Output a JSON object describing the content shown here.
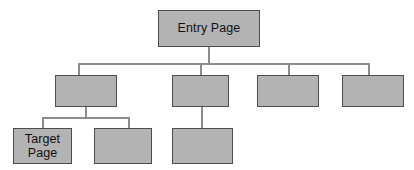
{
  "diagram": {
    "type": "site-map-tree",
    "colors": {
      "node_fill": "#b3b3b3",
      "node_border": "#4d4d4d",
      "connector": "#8c8c8c",
      "background": "#ffffff",
      "text": "#111111"
    },
    "levels": [
      {
        "name": "level-1",
        "nodes": [
          {
            "id": "entry-page",
            "label": "Entry Page",
            "x": 158,
            "y": 10,
            "w": 102,
            "h": 37
          }
        ]
      },
      {
        "name": "level-2",
        "nodes": [
          {
            "id": "level2-node-1",
            "label": "",
            "x": 55,
            "y": 75,
            "w": 62,
            "h": 32
          },
          {
            "id": "level2-node-2",
            "label": "",
            "x": 172,
            "y": 75,
            "w": 57,
            "h": 32
          },
          {
            "id": "level2-node-3",
            "label": "",
            "x": 257,
            "y": 75,
            "w": 62,
            "h": 32
          },
          {
            "id": "level2-node-4",
            "label": "",
            "x": 342,
            "y": 75,
            "w": 62,
            "h": 32
          }
        ]
      },
      {
        "name": "level-3",
        "nodes": [
          {
            "id": "target-page",
            "label": "Target\nPage",
            "x": 13,
            "y": 128,
            "w": 59,
            "h": 36
          },
          {
            "id": "level3-node-2",
            "label": "",
            "x": 94,
            "y": 128,
            "w": 58,
            "h": 36
          },
          {
            "id": "level3-node-3",
            "label": "",
            "x": 172,
            "y": 128,
            "w": 61,
            "h": 36
          }
        ]
      }
    ],
    "connectors": [
      {
        "id": "entry-stem-down",
        "orientation": "v",
        "x": 208,
        "y": 47,
        "length": 17
      },
      {
        "id": "level2-trunk",
        "orientation": "h",
        "x": 78,
        "y": 63,
        "length": 290
      },
      {
        "id": "branch-to-level2-node-1",
        "orientation": "v",
        "x": 78,
        "y": 63,
        "length": 12
      },
      {
        "id": "branch-to-level2-node-2",
        "orientation": "v",
        "x": 200,
        "y": 63,
        "length": 12
      },
      {
        "id": "branch-to-level2-node-3",
        "orientation": "v",
        "x": 288,
        "y": 63,
        "length": 12
      },
      {
        "id": "branch-to-level2-node-4",
        "orientation": "v",
        "x": 368,
        "y": 63,
        "length": 12
      },
      {
        "id": "level2-node-1-stem-down",
        "orientation": "v",
        "x": 85,
        "y": 107,
        "length": 11
      },
      {
        "id": "level3-trunk",
        "orientation": "h",
        "x": 42,
        "y": 117,
        "length": 86
      },
      {
        "id": "branch-to-target-page",
        "orientation": "v",
        "x": 42,
        "y": 117,
        "length": 12
      },
      {
        "id": "branch-to-level3-node-2",
        "orientation": "v",
        "x": 128,
        "y": 117,
        "length": 12
      },
      {
        "id": "level2-node-2-to-level3-node-3",
        "orientation": "v",
        "x": 201,
        "y": 107,
        "length": 22
      }
    ]
  }
}
